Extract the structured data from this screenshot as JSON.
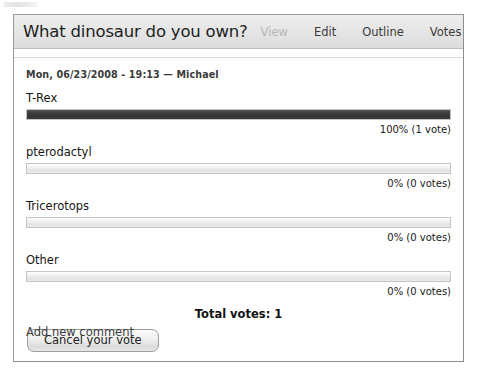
{
  "node": {
    "title": "What dinosaur do you own?",
    "submitted": "Mon, 06/23/2008 - 19:13 — Michael"
  },
  "tabs": [
    {
      "label": "View",
      "state": "active"
    },
    {
      "label": "Edit",
      "state": "inactive"
    },
    {
      "label": "Outline",
      "state": "inactive"
    },
    {
      "label": "Votes",
      "state": "inactive"
    }
  ],
  "poll": {
    "choices": [
      {
        "label": "T-Rex",
        "percent": 100,
        "meta": "100% (1 vote)"
      },
      {
        "label": "pterodactyl",
        "percent": 0,
        "meta": "0% (0 votes)"
      },
      {
        "label": "Tricerotops",
        "percent": 0,
        "meta": "0% (0 votes)"
      },
      {
        "label": "Other",
        "percent": 0,
        "meta": "0% (0 votes)"
      }
    ],
    "total_votes": "Total votes: 1",
    "cancel_label": "Cancel your vote"
  },
  "footer": {
    "add_comment": "Add new comment"
  },
  "colors": {
    "bar_fill": "#3a3a3a",
    "bar_track": "#ececec",
    "panel_border": "#9a9a9a",
    "header_bg": "#e6e6e6",
    "tab_active": "#b6b6b6"
  }
}
